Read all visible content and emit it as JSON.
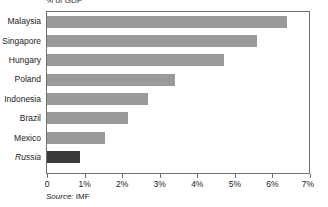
{
  "chart_data": {
    "type": "bar",
    "orientation": "horizontal",
    "title": "% of GDP",
    "xlabel": "",
    "ylabel": "",
    "categories": [
      "Malaysia",
      "Singapore",
      "Hungary",
      "Poland",
      "Indonesia",
      "Brazil",
      "Mexico",
      "Russia"
    ],
    "values": [
      6.4,
      5.6,
      4.7,
      3.4,
      2.7,
      2.15,
      1.55,
      0.88
    ],
    "value_unit": "% of GDP",
    "xlim": [
      0,
      7
    ],
    "xticks": [
      0,
      1,
      2,
      3,
      4,
      5,
      6,
      7
    ],
    "xtick_labels": [
      "0",
      "1%",
      "2%",
      "3%",
      "4%",
      "5%",
      "6%",
      "7%"
    ],
    "grid": false,
    "legend": false,
    "highlight_category": "Russia",
    "bar_color": "#9a9a9a",
    "highlight_color": "#3a3a3a",
    "axis_color": "#6f6f6f",
    "source_prefix": "Source:",
    "source_value": "IMF"
  },
  "labels": {
    "cat0": "Malaysia",
    "cat1": "Singapore",
    "cat2": "Hungary",
    "cat3": "Poland",
    "cat4": "Indonesia",
    "cat5": "Brazil",
    "cat6": "Mexico",
    "cat7": "Russia"
  },
  "xticks": {
    "t0": "0",
    "t1": "1%",
    "t2": "2%",
    "t3": "3%",
    "t4": "4%",
    "t5": "5%",
    "t6": "6%",
    "t7": "7%"
  }
}
